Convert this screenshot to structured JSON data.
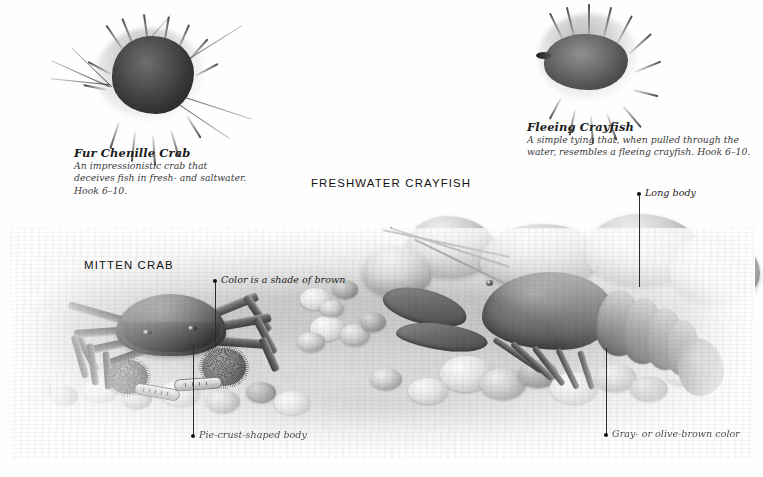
{
  "page": {
    "background_color": "#ffffff",
    "ink_color": "#1c1c1c",
    "leader_color": "#2b2b2b"
  },
  "flies": [
    {
      "name": "Fur Chenille Crab",
      "description": "An impressionistic crab that deceives fish in fresh- and saltwater. Hook 6–10.",
      "description_lines": [
        "An impressionistic crab that",
        "deceives fish in fresh- and saltwater.",
        "Hook 6–10."
      ],
      "image_name": "fur-chenille-crab-fly-photo"
    },
    {
      "name": "Fleeing Crayfish",
      "description": "A simple tying that, when pulled through the water, resembles a fleeing crayfish. Hook 6–10.",
      "description_lines": [
        "A simple tying that, when pulled through the",
        "water, resembles a fleeing crayfish. Hook 6–10."
      ],
      "image_name": "fleeing-crayfish-fly-photo"
    }
  ],
  "plates": [
    {
      "title": "FRESHWATER CRAYFISH",
      "subject_name": "freshwater-crayfish-illustration"
    },
    {
      "title": "MITTEN CRAB",
      "subject_name": "mitten-crab-illustration"
    }
  ],
  "callouts": [
    {
      "label": "Color is a shade of brown",
      "target": "mitten-crab-carapace"
    },
    {
      "label": "Pie-crust-shaped body",
      "target": "mitten-crab-body-edge"
    },
    {
      "label": "Long body",
      "target": "crayfish-abdomen"
    },
    {
      "label": "Gray- or olive-brown color",
      "target": "crayfish-coloration"
    }
  ]
}
